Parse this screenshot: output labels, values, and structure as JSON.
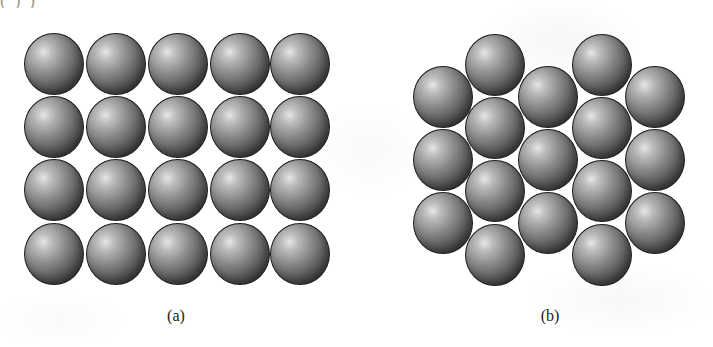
{
  "figure": {
    "top_text_fragment": "( )                                                        )",
    "sphere_radius_px": 30,
    "colors": {
      "background": "#ffffff",
      "sphere_highlight": "#e6e6e6",
      "sphere_mid": "#8a8a8a",
      "sphere_dark": "#2a2a2a",
      "sphere_outline": "#1a1a1a",
      "caption_text": "#222222"
    },
    "panels": [
      {
        "id": "a",
        "caption": "(a)",
        "caption_x": 176,
        "arrangement": "square packing",
        "rows": 4,
        "columns": 5,
        "sphere_count": 20,
        "column_centers_x": [
          54,
          116,
          178,
          240,
          300
        ],
        "row_centers_y": [
          64,
          127,
          190,
          254
        ]
      },
      {
        "id": "b",
        "caption": "(b)",
        "caption_x": 550,
        "arrangement": "hexagonal close packing",
        "columns": 5,
        "sphere_count": 17,
        "column_centers_x": [
          443,
          495,
          548,
          602,
          655
        ],
        "column_sphere_counts": [
          3,
          4,
          3,
          4,
          3
        ],
        "odd_column_centers_y": [
          97,
          160,
          223
        ],
        "even_column_centers_y": [
          65,
          128,
          191,
          255
        ]
      }
    ]
  }
}
